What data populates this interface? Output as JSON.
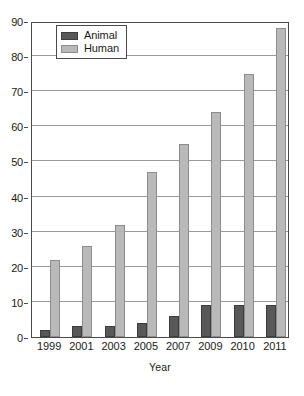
{
  "chart_data": {
    "type": "bar",
    "title": "",
    "subtitle": "",
    "xlabel": "Year",
    "ylabel": "",
    "categories": [
      "1999",
      "2001",
      "2003",
      "2005",
      "2007",
      "2009",
      "2010",
      "2011"
    ],
    "series": [
      {
        "name": "Animal",
        "color": "#585858",
        "values": [
          2,
          3,
          3,
          4,
          6,
          9,
          9,
          9
        ]
      },
      {
        "name": "Human",
        "color": "#b9b9b9",
        "values": [
          22,
          26,
          32,
          47,
          55,
          64,
          75,
          88
        ]
      }
    ],
    "ylim": [
      0,
      90
    ],
    "ytick_labels": [
      "0",
      "10",
      "20",
      "30",
      "40",
      "50",
      "60",
      "70",
      "80",
      "90"
    ],
    "ytick_values": [
      0,
      10,
      20,
      30,
      40,
      50,
      60,
      70,
      80,
      90
    ],
    "grid": true,
    "grid_axis": "y",
    "legend_position": "top-left",
    "legend_entries": [
      "Animal",
      "Human"
    ]
  }
}
